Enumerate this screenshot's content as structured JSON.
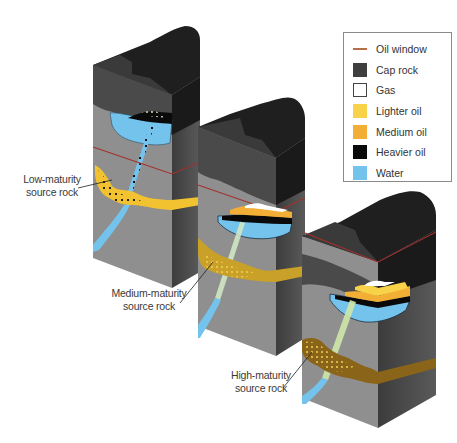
{
  "figure": {
    "stages": [
      {
        "id": "low",
        "label_line1": "Low-maturity",
        "label_line2": "source rock",
        "source_rock_color": "#f2c231",
        "trap_fill": [
          "Gas",
          "Heavier oil",
          "Water"
        ]
      },
      {
        "id": "medium",
        "label_line1": "Medium-maturity",
        "label_line2": "source rock",
        "source_rock_color": "#c9a028",
        "trap_fill": [
          "Gas",
          "Medium oil",
          "Heavier oil",
          "Water"
        ]
      },
      {
        "id": "high",
        "label_line1": "High-maturity",
        "label_line2": "source rock",
        "source_rock_color": "#8a6418",
        "trap_fill": [
          "Gas",
          "Lighter oil",
          "Medium oil",
          "Heavier oil",
          "Water"
        ]
      }
    ]
  },
  "legend": {
    "items": [
      {
        "label": "Oil window",
        "type": "line",
        "color": "#b5704a"
      },
      {
        "label": "Cap rock",
        "type": "box",
        "color": "#3e3e3e"
      },
      {
        "label": "Gas",
        "type": "box",
        "color": "#ffffff"
      },
      {
        "label": "Lighter oil",
        "type": "box",
        "color": "#f8d34a"
      },
      {
        "label": "Medium oil",
        "type": "box",
        "color": "#f3ae35"
      },
      {
        "label": "Heavier oil",
        "type": "box",
        "color": "#0a0a0a"
      },
      {
        "label": "Water",
        "type": "box",
        "color": "#73c3ec"
      }
    ]
  },
  "colors": {
    "front_rock": "#8d8d8d",
    "side_rock": "#505050",
    "cap_front": "#4a4a4a",
    "cap_top": "#1e1e1e",
    "oil_window": "#a3302c",
    "water": "#73c3ec",
    "heavy_oil": "#0a0a0a",
    "medium_oil": "#f3ae35",
    "lighter_oil": "#f8d34a",
    "gas": "#ffffff"
  }
}
